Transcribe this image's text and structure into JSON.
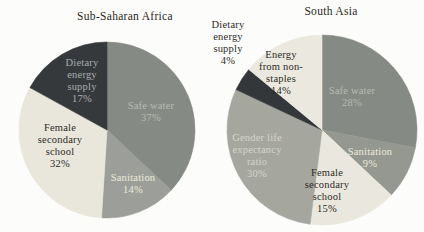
{
  "figure": {
    "background": "#fcfcfa",
    "title_color": "#2a2722"
  },
  "chart_data": [
    {
      "type": "pie",
      "title": "Sub-Saharan Africa",
      "legend_position": "none",
      "labels_on_slices": true,
      "slices": [
        {
          "id": "safe-water",
          "label": "Safe water",
          "value": 37,
          "color": "#868a85",
          "text_color": "#b7bbb3",
          "lines": [
            "Safe water",
            "37%"
          ],
          "label_x": 151,
          "label_y": 112
        },
        {
          "id": "sanitation",
          "label": "Sanitation",
          "value": 14,
          "color": "#9c9f99",
          "text_color": "#eceade",
          "lines": [
            "Sanitation",
            "14%"
          ],
          "label_x": 133,
          "label_y": 184
        },
        {
          "id": "female-secondary-school",
          "label": "Female secondary school",
          "value": 32,
          "color": "#e9e7dc",
          "text_color": "#2e2b26",
          "lines": [
            "Female",
            "secondary",
            "school",
            "32%"
          ],
          "label_x": 60,
          "label_y": 146
        },
        {
          "id": "dietary-energy-supply",
          "label": "Dietary energy supply",
          "value": 17,
          "color": "#36393c",
          "text_color": "#a8acac",
          "lines": [
            "Dietary",
            "energy",
            "supply",
            "17%"
          ],
          "label_x": 82,
          "label_y": 81
        }
      ]
    },
    {
      "type": "pie",
      "title": "South Asia",
      "legend_position": "none",
      "labels_on_slices": true,
      "slices": [
        {
          "id": "safe-water",
          "label": "Safe water",
          "value": 28,
          "color": "#868a85",
          "text_color": "#b7bbb3",
          "lines": [
            "Safe water",
            "28%"
          ],
          "label_x": 352,
          "label_y": 97
        },
        {
          "id": "sanitation",
          "label": "Sanitation",
          "value": 9,
          "color": "#959890",
          "text_color": "#eceade",
          "lines": [
            "Sanitation",
            "9%"
          ],
          "label_x": 370,
          "label_y": 158
        },
        {
          "id": "female-secondary-school",
          "label": "Female secondary school",
          "value": 15,
          "color": "#eae8de",
          "text_color": "#2e2b26",
          "lines": [
            "Female",
            "secondary",
            "school",
            "15%"
          ],
          "label_x": 327,
          "label_y": 191
        },
        {
          "id": "gender-life-expectancy-ratio",
          "label": "Gender life expectancy ratio",
          "value": 30,
          "color": "#a5a79f",
          "text_color": "#d6d3c8",
          "lines": [
            "Gender life",
            "expectancy",
            "ratio",
            "30%"
          ],
          "label_x": 257,
          "label_y": 156
        },
        {
          "id": "dietary-energy-supply",
          "label": "Dietary energy supply",
          "value": 4,
          "color": "#34373a",
          "text_color": "#2e2b26",
          "label_outside": true,
          "lines": [
            "Dietary",
            "energy",
            "supply",
            "4%"
          ],
          "label_x": 228,
          "label_y": 43
        },
        {
          "id": "energy-from-non-staples",
          "label": "Energy from non-staples",
          "value": 14,
          "color": "#ebe9df",
          "text_color": "#2e2b26",
          "lines": [
            "Energy",
            "from non-",
            "staples",
            "14%"
          ],
          "label_x": 281,
          "label_y": 73
        }
      ]
    }
  ]
}
